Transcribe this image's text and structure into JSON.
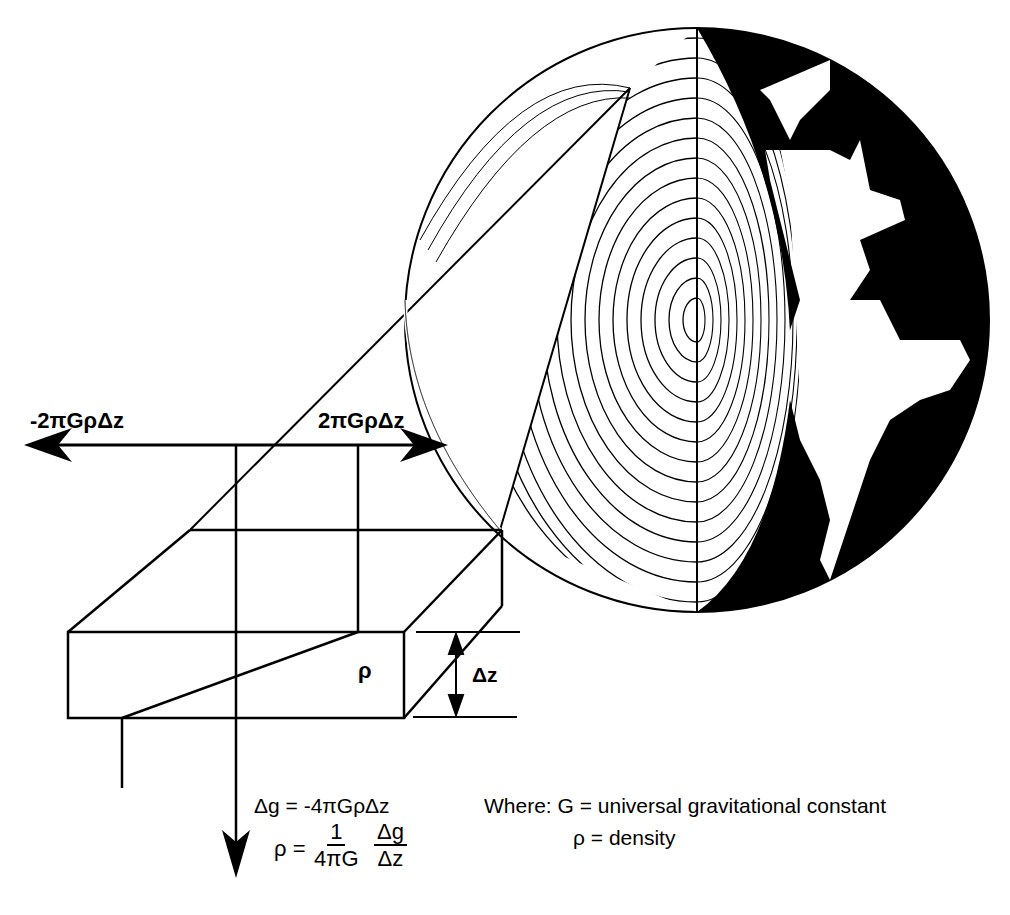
{
  "figure": {
    "type": "diagram"
  },
  "labels": {
    "left_arrow": "-2πGρΔz",
    "right_arrow": "2πGρΔz",
    "slab_density": "ρ",
    "thickness": "Δz",
    "delta_g_equation": "Δg = -4πGρΔz",
    "rho_prefix": "ρ =",
    "rho_frac1_num": "1",
    "rho_frac1_den": "4πG",
    "rho_frac2_num": "Δg",
    "rho_frac2_den": "Δz",
    "where_g": "Where: G =  universal gravitational constant",
    "where_rho": "ρ  =  density"
  },
  "colors": {
    "ink": "#000000",
    "background": "#ffffff"
  }
}
